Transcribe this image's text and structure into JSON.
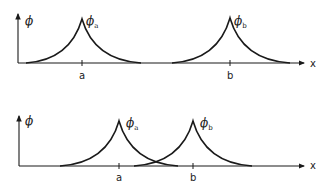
{
  "diagram": {
    "panels": [
      {
        "id": "separated",
        "y_axis_label": "ϕ",
        "x_axis_label": "x",
        "curves": [
          {
            "label_main": "ϕ",
            "label_sub": "a",
            "site_label": "a"
          },
          {
            "label_main": "ϕ",
            "label_sub": "b",
            "site_label": "b"
          }
        ]
      },
      {
        "id": "overlapping",
        "y_axis_label": "ϕ",
        "x_axis_label": "x",
        "curves": [
          {
            "label_main": "ϕ",
            "label_sub": "a",
            "site_label": "a"
          },
          {
            "label_main": "ϕ",
            "label_sub": "b",
            "site_label": "b"
          }
        ]
      }
    ],
    "colors": {
      "line": "#1a1a1a",
      "background": "#ffffff"
    }
  }
}
